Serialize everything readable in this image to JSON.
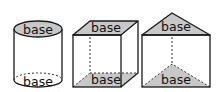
{
  "figure": {
    "shapes": [
      {
        "name": "cylinder",
        "top_label": "base",
        "bottom_label": "base"
      },
      {
        "name": "rectangular-prism",
        "top_label": "base",
        "bottom_label": "base"
      },
      {
        "name": "triangular-prism",
        "top_label": "base",
        "bottom_label": "base"
      }
    ],
    "colors": {
      "base_fill": "#c8c8c8",
      "edge": "#1a1a1a",
      "background": "#ffffff"
    }
  }
}
